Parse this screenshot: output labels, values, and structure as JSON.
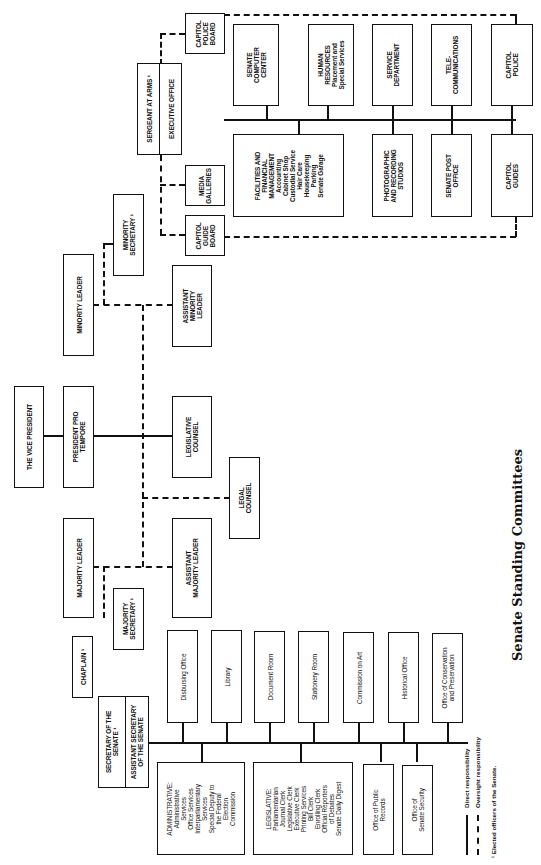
{
  "caption": "Senate Standing Committees",
  "top": {
    "vice_president": "THE VICE PRESIDENT",
    "president_pro_tempore": "PRESIDENT PRO\nTEMPORE",
    "legislative_counsel": "LEGISLATIVE\nCOUNSEL",
    "legal_counsel": "LEGAL\nCOUNSEL",
    "minority_leader": "MINORITY LEADER",
    "minority_secretary": "MINORITY\nSECRETARY ¹",
    "assistant_minority_leader": "ASSISTANT\nMINORITY\nLEADER",
    "majority_leader": "MAJORITY LEADER",
    "majority_secretary": "MAJORITY\nSECRETARY ¹",
    "assistant_majority_leader": "ASSISTANT\nMAJORITY LEADER",
    "chaplain": "CHAPLAIN ¹"
  },
  "sergeant": {
    "title": "SERGEANT AT ARMS ¹",
    "executive_office": "EXECUTIVE OFFICE",
    "capitol_police_board": "CAPITOL\nPOLICE\nBOARD",
    "media_galleries": "MEDIA\nGALLERIES",
    "capitol_guide_board": "CAPITOL\nGUIDE\nBOARD",
    "upper_row": [
      "SENATE\nCOMPUTER\nCENTER",
      "HUMAN\nRESOURCES\nPlacement and\nSpecial Services",
      "SERVICE\nDEPARTMENT",
      "TELE-\nCOMMUNICATIONS",
      "CAPITOL\nPOLICE"
    ],
    "lower_row": [
      "FACILITIES AND\nFINANCIAL\nMANAGEMENT\nAccounting\nCabinet Shop\nCustodial Service\nHair Care\nHousekeeping\nParking\nSenate Garage",
      "PHOTOGRAPHIC\nAND RECORDING\nSTUDIOS",
      "SENATE POST\nOFFICE",
      "CAPITOL\nGUIDES"
    ]
  },
  "secretary": {
    "title": "SECRETARY OF THE\nSENATE ¹",
    "assistant": "ASSISTANT SECRETARY\nOF THE SENATE",
    "upper_row": [
      "Disbursing Office",
      "Library",
      "Document Room",
      "Stationery Room",
      "Commission on Art",
      "Historical Office",
      "Office of Conservation\nand Preservation"
    ],
    "lower_row": [
      "ADMINISTRATIVE:\nAdministrative\nServices\nOffice Services\nInterparliamentary\nServices\nSpecial Deputy to\nthe Federal\nElection\nCommission",
      "LEGISLATIVE:\nParliamentarian\nJournal Clerk\nLegislative Clerk\nExecutive Clerk\nPrinting Services\nBill Clerk\nEnrolling Clerk\nOfficial Reporters\nof Debates\nSenate Daily Digest",
      "Office of Public\nRecords",
      "Office of\nSenate Security"
    ]
  },
  "legend": {
    "direct": "Direct responsibility",
    "oversight": "Oversight responsibility",
    "footnote": "¹ Elected officers of the Senate."
  }
}
